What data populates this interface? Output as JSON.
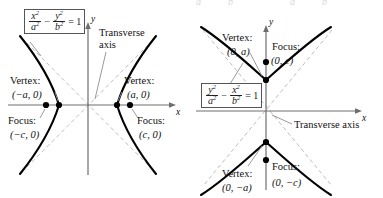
{
  "figure": {
    "colors": {
      "curve": "#000000",
      "axis": "#666666",
      "asymptote": "#b9b9b9",
      "leader": "#9a9a9a",
      "box_border": "#555555",
      "background": "#ffffff"
    },
    "ghost_top_row": [
      {
        "text": "a",
        "x": 196
      },
      {
        "text": "b",
        "x": 228
      },
      {
        "text": "a",
        "x": 290
      },
      {
        "text": "b",
        "x": 322
      }
    ]
  },
  "left_panel": {
    "name": "horizontal-transverse-axis-hyperbola",
    "equation": {
      "num1": "x",
      "den1": "a",
      "op": "−",
      "num2": "y",
      "den2": "b",
      "rhs": "= 1",
      "exp": "2",
      "plain": "x²/a² − y²/b² = 1"
    },
    "axis_x_label": "x",
    "axis_y_label": "y",
    "transverse_axis_line1": "Transverse",
    "transverse_axis_line2": "axis",
    "vertex_left_label": "Vertex:",
    "vertex_left_coord": "(−a, 0)",
    "vertex_right_label": "Vertex:",
    "vertex_right_coord": "(a, 0)",
    "focus_left_label": "Focus:",
    "focus_left_coord": "(−c, 0)",
    "focus_right_label": "Focus:",
    "focus_right_coord": "(c, 0)"
  },
  "right_panel": {
    "name": "vertical-transverse-axis-hyperbola",
    "equation": {
      "num1": "y",
      "den1": "a",
      "op": "−",
      "num2": "x",
      "den2": "b",
      "rhs": "= 1",
      "exp": "2",
      "plain": "y²/a² − x²/b² = 1"
    },
    "axis_x_label": "x",
    "axis_y_label": "y",
    "transverse_axis_label": "Transverse axis",
    "vertex_top_label": "Vertex:",
    "vertex_top_coord": "(0, a)",
    "vertex_bottom_label": "Vertex:",
    "vertex_bottom_coord": "(0, −a)",
    "focus_top_label": "Focus:",
    "focus_top_coord": "(0, c)",
    "focus_bottom_label": "Focus:",
    "focus_bottom_coord": "(0, −c)"
  }
}
